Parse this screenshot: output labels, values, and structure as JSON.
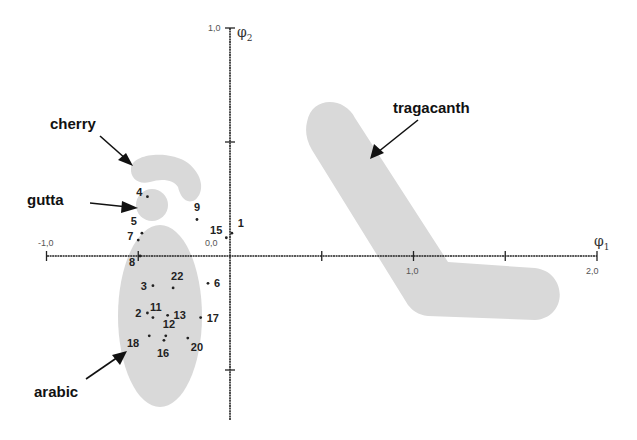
{
  "chart_data": {
    "type": "scatter",
    "title": "",
    "xlabel": "φ1",
    "ylabel": "φ2",
    "xlim": [
      -1.0,
      2.0
    ],
    "ylim": [
      -0.9,
      1.0
    ],
    "x_ticks": [
      -1.0,
      -0.5,
      0.0,
      0.5,
      1.0,
      1.5,
      2.0
    ],
    "x_tick_labels": [
      {
        "value": -1.0,
        "label": "-1,0"
      },
      {
        "value": 0.0,
        "label": "0,0"
      },
      {
        "value": 1.0,
        "label": "1,0"
      },
      {
        "value": 2.0,
        "label": "2,0"
      }
    ],
    "y_ticks": [
      -0.5,
      0.5,
      1.0
    ],
    "y_tick_labels": [
      {
        "value": 1.0,
        "label": "1,0"
      }
    ],
    "origin_label": "0,0",
    "grid": false,
    "points": [
      {
        "id": "1",
        "x": 0.01,
        "y": 0.1
      },
      {
        "id": "2",
        "x": -0.45,
        "y": -0.25
      },
      {
        "id": "3",
        "x": -0.42,
        "y": -0.13
      },
      {
        "id": "4",
        "x": -0.45,
        "y": 0.26
      },
      {
        "id": "5",
        "x": -0.48,
        "y": 0.1
      },
      {
        "id": "6",
        "x": -0.12,
        "y": -0.12
      },
      {
        "id": "7",
        "x": -0.5,
        "y": 0.07
      },
      {
        "id": "8",
        "x": -0.49,
        "y": 0.0
      },
      {
        "id": "9",
        "x": -0.18,
        "y": 0.16
      },
      {
        "id": "11",
        "x": -0.42,
        "y": -0.27
      },
      {
        "id": "12",
        "x": -0.35,
        "y": -0.35
      },
      {
        "id": "13",
        "x": -0.34,
        "y": -0.26
      },
      {
        "id": "15",
        "x": -0.02,
        "y": 0.08
      },
      {
        "id": "16",
        "x": -0.36,
        "y": -0.37
      },
      {
        "id": "17",
        "x": -0.16,
        "y": -0.27
      },
      {
        "id": "18",
        "x": -0.44,
        "y": -0.35
      },
      {
        "id": "20",
        "x": -0.23,
        "y": -0.36
      },
      {
        "id": "22",
        "x": -0.31,
        "y": -0.14
      }
    ],
    "groups": [
      {
        "name": "cherry",
        "label": "cherry",
        "members": []
      },
      {
        "name": "gutta",
        "label": "gutta",
        "members": [
          "4"
        ]
      },
      {
        "name": "tragacanth",
        "label": "tragacanth",
        "members": []
      },
      {
        "name": "arabic",
        "label": "arabic",
        "members": [
          "2",
          "3",
          "11",
          "12",
          "13",
          "16",
          "18",
          "22"
        ]
      }
    ],
    "colors": {
      "region": "#d9d9d9",
      "axis": "#222222",
      "text": "#111111"
    }
  }
}
